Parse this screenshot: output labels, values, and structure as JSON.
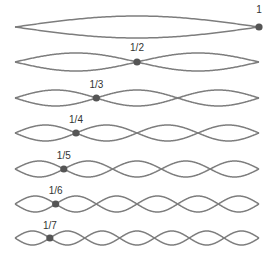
{
  "diagram": {
    "title": "",
    "x_start": 15,
    "x_end": 259,
    "stroke_color": "#7d7d7d",
    "dot_color": "#555555",
    "rows": [
      {
        "label": "1",
        "harmonic": 1,
        "y": 27,
        "amp": 11
      },
      {
        "label": "1/2",
        "harmonic": 2,
        "y": 62,
        "amp": 9
      },
      {
        "label": "1/3",
        "harmonic": 3,
        "y": 98,
        "amp": 8
      },
      {
        "label": "1/4",
        "harmonic": 4,
        "y": 133,
        "amp": 8
      },
      {
        "label": "1/5",
        "harmonic": 5,
        "y": 169,
        "amp": 8
      },
      {
        "label": "1/6",
        "harmonic": 6,
        "y": 204,
        "amp": 8
      },
      {
        "label": "1/7",
        "harmonic": 7,
        "y": 238,
        "amp": 7
      }
    ]
  }
}
